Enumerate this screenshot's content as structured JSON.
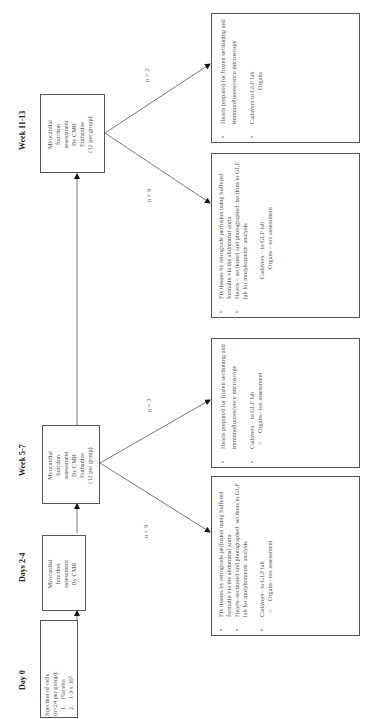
{
  "timeline": [
    {
      "label": "Day 0"
    },
    {
      "label": "Days 2-4"
    },
    {
      "label": "Week 5-7"
    },
    {
      "label": "Week 11-13"
    }
  ],
  "day0_box": {
    "title": "Injection of cells",
    "subtitle": "(n=24 per group):",
    "groups": [
      {
        "num": "1.",
        "text": "Placebo"
      },
      {
        "num": "2.",
        "text": "1-3 x 10⁵"
      },
      {
        "num": "3.",
        "text": "1 x 10⁶"
      },
      {
        "num": "4.",
        "text": "5-10 x 10⁶"
      }
    ]
  },
  "days24_box": {
    "lines": [
      "Myocardial",
      "function",
      "assessment",
      "By CMR"
    ]
  },
  "week57_box": {
    "lines": [
      "Myocardial",
      "function",
      "assessment",
      "By CMR",
      "Euthanize",
      "(12 per group)"
    ]
  },
  "week1113_box": {
    "lines": [
      "Myocardial",
      "function",
      "assessment",
      "By CMR",
      "Euthanize",
      "(12 per group)"
    ]
  },
  "branches": {
    "week57_n9": "n = 9",
    "week57_n3": "n = 3",
    "week1113_n9": "n = 9",
    "week1113_n3": "n = 3"
  },
  "outcome_boxes": {
    "w57_fix": {
      "bullet1": "Fix tissues by retrograde perfusion using buffered formalin via the abdominal aorta",
      "bullet2": "Hearts–sectioned and photographed: sections to GLP lab for morphometric analysis",
      "bullet3": "Cadavers– to GLP lab",
      "sub": "Organs– tox assessment"
    },
    "w57_hearts": {
      "bullet1": "Hearts prepared for frozen sectioning and immunofluorescence microscopy",
      "bullet2": "Cadavers – to GLP lab",
      "sub": "Organs– tox assessment"
    },
    "w1113_fix": {
      "bullet1": "Fix tissues by retrograde perfusion using buffered formalin via the abdominal aorta",
      "bullet2": "Hearts – sectioned and photographed: sections to GLP lab for morphometric analysis",
      "line3": "Cadavers – to GLP lab",
      "sub": "Organs – tox assessment"
    },
    "w1113_hearts": {
      "bullet1": "Hearts prepared for frozen sectioning and immunofluorescence microscopy",
      "bullet2": "Cadavers  to GLP lab",
      "sub": "Organs"
    }
  },
  "bullet_glyph": "•",
  "sub_glyph": "○"
}
